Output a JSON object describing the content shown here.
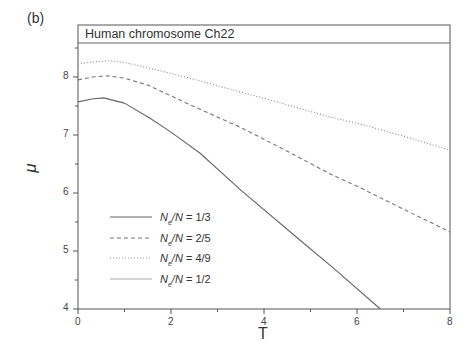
{
  "panel_label": "(b)",
  "chart_data": {
    "type": "line",
    "title": "Human chromosome Ch22",
    "xlabel": "T",
    "ylabel": "μ",
    "xlim": [
      0,
      8
    ],
    "ylim": [
      4,
      8.9
    ],
    "xticks": [
      "0",
      "2",
      "4",
      "6",
      "8"
    ],
    "yticks": [
      "4",
      "5",
      "6",
      "7",
      "8"
    ],
    "grid": false,
    "legend_position": "lower left (inside)",
    "series": [
      {
        "name": "Ne/N = 1/3",
        "style": "solid",
        "color": "#666666",
        "x": [
          0,
          0.3,
          0.55,
          1.0,
          1.55,
          2.0,
          2.62,
          3.5,
          4.77,
          5.5,
          6.5
        ],
        "y": [
          7.57,
          7.62,
          7.64,
          7.55,
          7.29,
          7.05,
          6.69,
          6.05,
          5.19,
          4.7,
          4.0
        ]
      },
      {
        "name": "Ne/N = 2/5",
        "style": "dashed",
        "color": "#777777",
        "x": [
          0,
          0.3,
          0.65,
          1.0,
          1.5,
          2.41,
          3.5,
          4.5,
          5.42,
          6.07,
          7.0,
          8.0
        ],
        "y": [
          7.95,
          8.0,
          8.02,
          7.98,
          7.86,
          7.52,
          7.13,
          6.72,
          6.33,
          6.09,
          5.72,
          5.33
        ]
      },
      {
        "name": "Ne/N = 4/9",
        "style": "dotted",
        "color": "#888888",
        "x": [
          0,
          0.3,
          0.7,
          1.0,
          1.5,
          2.41,
          3.5,
          4.5,
          5.42,
          6.07,
          7.0,
          8.0
        ],
        "y": [
          8.22,
          8.26,
          8.28,
          8.25,
          8.16,
          7.98,
          7.74,
          7.52,
          7.31,
          7.19,
          6.98,
          6.74
        ]
      },
      {
        "name": "Ne/N = 1/2",
        "style": "solid",
        "color": "#aaaaaa",
        "x": [],
        "y": []
      }
    ]
  },
  "legend": [
    {
      "prefix": "N",
      "sub": "e",
      "suffix": "/N",
      "eq": " = 1/3"
    },
    {
      "prefix": "N",
      "sub": "e",
      "suffix": "/N",
      "eq": " = 2/5"
    },
    {
      "prefix": "N",
      "sub": "e",
      "suffix": "/N",
      "eq": " = 4/9"
    },
    {
      "prefix": "N",
      "sub": "e",
      "suffix": "/N",
      "eq": " = 1/2"
    }
  ]
}
